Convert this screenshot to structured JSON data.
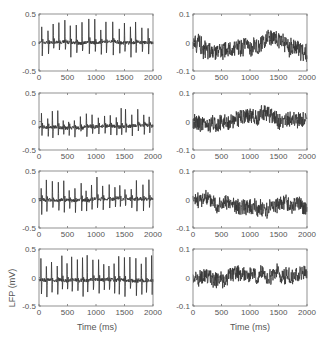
{
  "figure": {
    "ylabel": "LFP (mV)",
    "xlabel": "Time (ms)",
    "frame_color": "#777777",
    "trace_color": "#333333",
    "tick_text_color": "#555555"
  },
  "chart_data": [
    {
      "type": "line",
      "panel": "row1-left",
      "title": "",
      "xlabel": "",
      "ylabel": "",
      "xlim": [
        0,
        2000
      ],
      "ylim": [
        -0.5,
        0.5
      ],
      "xticks": [
        0,
        500,
        1000,
        1500,
        2000
      ],
      "yticks": [
        -0.5,
        0,
        0.5
      ],
      "ytick_labels": [
        "-0.5",
        "0",
        "0.5"
      ],
      "description": "periodic spiking LFP, spikes every ~100 ms, peaks ~0.2-0.45, troughs ~-0.2",
      "signal": {
        "kind": "spiky",
        "seed": 11,
        "period": 105,
        "amp": [
          0.2,
          0.42
        ],
        "trough": 0.2,
        "offset": 0.0,
        "noise": 0.03
      }
    },
    {
      "type": "line",
      "panel": "row1-right",
      "title": "",
      "xlabel": "",
      "ylabel": "",
      "xlim": [
        0,
        2000
      ],
      "ylim": [
        -0.1,
        0.1
      ],
      "xticks": [
        0,
        500,
        1000,
        1500,
        2000
      ],
      "yticks": [
        -0.1,
        0,
        0.1
      ],
      "ytick_labels": [
        "-0.1",
        "0",
        "0.1"
      ],
      "description": "irregular low-amplitude LFP, range ~-0.07 to 0.08",
      "signal": {
        "kind": "noisy",
        "seed": 21,
        "amp": 0.028,
        "offset": -0.005
      }
    },
    {
      "type": "line",
      "panel": "row2-left",
      "title": "",
      "xlabel": "",
      "ylabel": "",
      "xlim": [
        0,
        2000
      ],
      "ylim": [
        -0.5,
        0.5
      ],
      "xticks": [
        0,
        500,
        1000,
        1500,
        2000
      ],
      "yticks": [
        -0.5,
        0,
        0.5
      ],
      "ytick_labels": [
        "-0.5",
        "0",
        "0.5"
      ],
      "description": "periodic spiking LFP, peaks up to ~0.3, baseline ~-0.1",
      "signal": {
        "kind": "spiky",
        "seed": 12,
        "period": 95,
        "amp": [
          0.08,
          0.32
        ],
        "trough": 0.15,
        "offset": -0.1,
        "noise": 0.03
      }
    },
    {
      "type": "line",
      "panel": "row2-right",
      "title": "",
      "xlabel": "",
      "ylabel": "",
      "xlim": [
        0,
        2000
      ],
      "ylim": [
        -0.1,
        0.1
      ],
      "xticks": [
        0,
        500,
        1000,
        1500,
        2000
      ],
      "yticks": [
        -0.1,
        0,
        0.1
      ],
      "ytick_labels": [
        "-0.1",
        "0",
        "0.1"
      ],
      "description": "irregular low-amplitude LFP, range ~-0.04 to 0.08",
      "signal": {
        "kind": "noisy",
        "seed": 22,
        "amp": 0.025,
        "offset": 0.005
      }
    },
    {
      "type": "line",
      "panel": "row3-left",
      "title": "",
      "xlabel": "",
      "ylabel": "",
      "xlim": [
        0,
        2000
      ],
      "ylim": [
        -0.5,
        0.5
      ],
      "xticks": [
        0,
        500,
        1000,
        1500,
        2000
      ],
      "yticks": [
        -0.5,
        0,
        0.5
      ],
      "ytick_labels": [
        "-0.5",
        "0",
        "0.5"
      ],
      "description": "periodic spiking LFP, peaks ~0.2-0.4, troughs ~-0.2",
      "signal": {
        "kind": "spiky",
        "seed": 13,
        "period": 100,
        "amp": [
          0.15,
          0.38
        ],
        "trough": 0.2,
        "offset": 0.0,
        "noise": 0.03
      }
    },
    {
      "type": "line",
      "panel": "row3-right",
      "title": "",
      "xlabel": "",
      "ylabel": "",
      "xlim": [
        0,
        2000
      ],
      "ylim": [
        -0.1,
        0.1
      ],
      "xticks": [
        0,
        500,
        1000,
        1500,
        2000
      ],
      "yticks": [
        -0.1,
        0,
        0.1
      ],
      "ytick_labels": [
        "-0.1",
        "0",
        "0.1"
      ],
      "description": "irregular low-amplitude LFP, range ~-0.07 to 0.05",
      "signal": {
        "kind": "noisy",
        "seed": 23,
        "amp": 0.025,
        "offset": -0.01
      }
    },
    {
      "type": "line",
      "panel": "row4-left",
      "title": "",
      "xlabel": "Time (ms)",
      "ylabel": "LFP (mV)",
      "xlim": [
        0,
        2000
      ],
      "ylim": [
        -0.5,
        0.5
      ],
      "xticks": [
        0,
        500,
        1000,
        1500,
        2000
      ],
      "yticks": [
        -0.5,
        0,
        0.5
      ],
      "ytick_labels": [
        "-0.5",
        "0",
        "0.5"
      ],
      "description": "periodic spiking LFP, peaks ~0.3-0.45, troughs ~-0.25",
      "signal": {
        "kind": "spiky",
        "seed": 14,
        "period": 92,
        "amp": [
          0.25,
          0.45
        ],
        "trough": 0.25,
        "offset": -0.05,
        "noise": 0.03
      }
    },
    {
      "type": "line",
      "panel": "row4-right",
      "title": "",
      "xlabel": "Time (ms)",
      "ylabel": "",
      "xlim": [
        0,
        2000
      ],
      "ylim": [
        -0.1,
        0.1
      ],
      "xticks": [
        0,
        500,
        1000,
        1500,
        2000
      ],
      "yticks": [
        -0.1,
        0,
        0.1
      ],
      "ytick_labels": [
        "-0.1",
        "0",
        "0.1"
      ],
      "description": "irregular low-amplitude LFP, range ~-0.06 to 0.05",
      "signal": {
        "kind": "noisy",
        "seed": 24,
        "amp": 0.025,
        "offset": 0.0
      }
    }
  ]
}
